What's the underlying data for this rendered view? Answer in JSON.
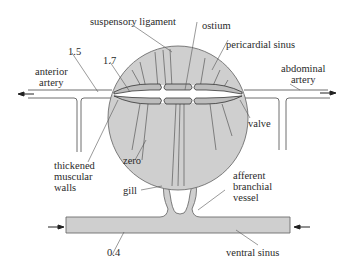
{
  "diagram": {
    "colors": {
      "fill": "#cfcfcf",
      "outline": "#6e6e6e",
      "line": "#555555",
      "text": "#2a2a2a"
    },
    "labels": {
      "suspensory_ligament": "suspensory ligament",
      "ostium": "ostium",
      "pericardial_sinus": "pericardial sinus",
      "pressure_1_5": "1.5",
      "pressure_1_7": "1.7",
      "anterior_artery": "anterior\nartery",
      "abdominal_artery": "abdominal\nartery",
      "valve": "valve",
      "thickened_muscular_walls": "thickened\nmuscular\nwalls",
      "zero": "zero",
      "gill": "gill",
      "afferent_branchial_vessel": "afferent\nbranchial\nvessel",
      "pressure_0_4": "0.4",
      "ventral_sinus": "ventral sinus"
    },
    "flow_arrows": [
      {
        "name": "anterior-outflow",
        "direction": "left"
      },
      {
        "name": "abdominal-outflow",
        "direction": "right"
      },
      {
        "name": "ventral-inflow-left",
        "direction": "right"
      },
      {
        "name": "ventral-inflow-right",
        "direction": "left"
      }
    ]
  }
}
